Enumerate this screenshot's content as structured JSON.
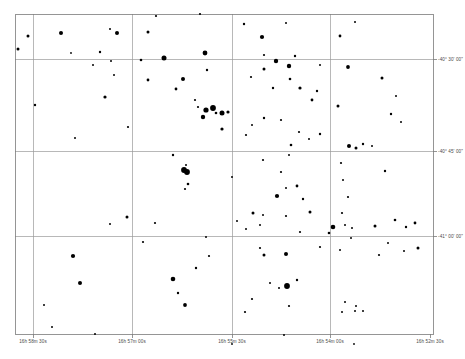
{
  "chart_data": {
    "type": "scatter",
    "title": "",
    "xlabel": "",
    "ylabel": "",
    "grid": true,
    "legend": null,
    "projection": "equatorial-finder-chart",
    "axes": {
      "x_tick_labels": [
        "16h 58m 30s",
        "16h 57m 00s",
        "16h 55m 30s",
        "16h 54m 00s",
        "16h 52m 30s"
      ],
      "x_tick_px": [
        33,
        132,
        232,
        330,
        430
      ],
      "y_tick_labels": [
        "-40° 30' 00\"",
        "-40° 45' 00\"",
        "-41° 00' 00\""
      ],
      "y_tick_px": [
        59,
        151,
        236
      ],
      "frame_px": {
        "left": 15,
        "top": 14,
        "right": 433,
        "bottom": 334
      },
      "grid_lines_x_px": [
        33,
        132,
        232,
        330
      ],
      "grid_lines_y_px": [
        59,
        151,
        236
      ]
    },
    "point_marker": "filled-circle",
    "point_color": "#000000",
    "point_size_meaning": "brighter stars drawn larger",
    "points": [
      {
        "x": 28,
        "y": 36,
        "r": 1.5
      },
      {
        "x": 18,
        "y": 49,
        "r": 1.5
      },
      {
        "x": 61,
        "y": 33,
        "r": 2.0
      },
      {
        "x": 110,
        "y": 29,
        "r": 1.0
      },
      {
        "x": 117,
        "y": 33,
        "r": 2.0
      },
      {
        "x": 71,
        "y": 53,
        "r": 0.9
      },
      {
        "x": 100,
        "y": 52,
        "r": 1.2
      },
      {
        "x": 93,
        "y": 65,
        "r": 1.0
      },
      {
        "x": 111,
        "y": 61,
        "r": 1.0
      },
      {
        "x": 114,
        "y": 75,
        "r": 1.0
      },
      {
        "x": 35,
        "y": 105,
        "r": 1.2
      },
      {
        "x": 105,
        "y": 97,
        "r": 1.6
      },
      {
        "x": 128,
        "y": 127,
        "r": 1.1
      },
      {
        "x": 75,
        "y": 138,
        "r": 1.0
      },
      {
        "x": 156,
        "y": 16,
        "r": 1.1
      },
      {
        "x": 148,
        "y": 32,
        "r": 1.5
      },
      {
        "x": 200,
        "y": 14,
        "r": 1.1
      },
      {
        "x": 141,
        "y": 60,
        "r": 1.3
      },
      {
        "x": 164,
        "y": 58,
        "r": 2.5
      },
      {
        "x": 205,
        "y": 53,
        "r": 2.4
      },
      {
        "x": 148,
        "y": 80,
        "r": 1.4
      },
      {
        "x": 183,
        "y": 79,
        "r": 2.0
      },
      {
        "x": 176,
        "y": 89,
        "r": 1.4
      },
      {
        "x": 207,
        "y": 70,
        "r": 1.2
      },
      {
        "x": 198,
        "y": 107,
        "r": 1.1
      },
      {
        "x": 206,
        "y": 110,
        "r": 2.6
      },
      {
        "x": 213,
        "y": 108,
        "r": 2.9
      },
      {
        "x": 216,
        "y": 113,
        "r": 1.3
      },
      {
        "x": 222,
        "y": 113,
        "r": 2.5
      },
      {
        "x": 228,
        "y": 112,
        "r": 1.6
      },
      {
        "x": 203,
        "y": 117,
        "r": 2.2
      },
      {
        "x": 195,
        "y": 100,
        "r": 1.1
      },
      {
        "x": 222,
        "y": 129,
        "r": 1.6
      },
      {
        "x": 173,
        "y": 155,
        "r": 1.2
      },
      {
        "x": 186,
        "y": 165,
        "r": 1.0
      },
      {
        "x": 184,
        "y": 170,
        "r": 2.9
      },
      {
        "x": 244,
        "y": 24,
        "r": 1.2
      },
      {
        "x": 286,
        "y": 23,
        "r": 1.0
      },
      {
        "x": 340,
        "y": 36,
        "r": 1.4
      },
      {
        "x": 355,
        "y": 22,
        "r": 1.0
      },
      {
        "x": 262,
        "y": 37,
        "r": 2.1
      },
      {
        "x": 264,
        "y": 55,
        "r": 1.1
      },
      {
        "x": 295,
        "y": 56,
        "r": 1.2
      },
      {
        "x": 264,
        "y": 69,
        "r": 1.5
      },
      {
        "x": 276,
        "y": 61,
        "r": 2.2
      },
      {
        "x": 289,
        "y": 66,
        "r": 2.2
      },
      {
        "x": 320,
        "y": 65,
        "r": 1.0
      },
      {
        "x": 348,
        "y": 67,
        "r": 1.9
      },
      {
        "x": 251,
        "y": 77,
        "r": 1.1
      },
      {
        "x": 290,
        "y": 79,
        "r": 1.3
      },
      {
        "x": 273,
        "y": 88,
        "r": 1.2
      },
      {
        "x": 300,
        "y": 88,
        "r": 1.6
      },
      {
        "x": 312,
        "y": 100,
        "r": 1.4
      },
      {
        "x": 317,
        "y": 91,
        "r": 1.2
      },
      {
        "x": 382,
        "y": 78,
        "r": 1.5
      },
      {
        "x": 396,
        "y": 96,
        "r": 1.0
      },
      {
        "x": 338,
        "y": 106,
        "r": 1.5
      },
      {
        "x": 252,
        "y": 125,
        "r": 1.0
      },
      {
        "x": 264,
        "y": 118,
        "r": 1.2
      },
      {
        "x": 281,
        "y": 120,
        "r": 1.1
      },
      {
        "x": 246,
        "y": 135,
        "r": 1.1
      },
      {
        "x": 291,
        "y": 145,
        "r": 1.3
      },
      {
        "x": 299,
        "y": 132,
        "r": 1.1
      },
      {
        "x": 309,
        "y": 139,
        "r": 1.0
      },
      {
        "x": 320,
        "y": 134,
        "r": 1.2
      },
      {
        "x": 349,
        "y": 146,
        "r": 2.0
      },
      {
        "x": 356,
        "y": 148,
        "r": 1.5
      },
      {
        "x": 363,
        "y": 144,
        "r": 1.2
      },
      {
        "x": 372,
        "y": 146,
        "r": 1.0
      },
      {
        "x": 391,
        "y": 114,
        "r": 1.2
      },
      {
        "x": 401,
        "y": 122,
        "r": 1.0
      },
      {
        "x": 263,
        "y": 160,
        "r": 1.1
      },
      {
        "x": 289,
        "y": 155,
        "r": 1.0
      },
      {
        "x": 188,
        "y": 184,
        "r": 1.3
      },
      {
        "x": 185,
        "y": 189,
        "r": 1.1
      },
      {
        "x": 187,
        "y": 172,
        "r": 2.9
      },
      {
        "x": 232,
        "y": 177,
        "r": 1.0
      },
      {
        "x": 281,
        "y": 172,
        "r": 1.1
      },
      {
        "x": 286,
        "y": 188,
        "r": 1.0
      },
      {
        "x": 297,
        "y": 186,
        "r": 1.4
      },
      {
        "x": 341,
        "y": 163,
        "r": 1.1
      },
      {
        "x": 343,
        "y": 180,
        "r": 1.0
      },
      {
        "x": 385,
        "y": 171,
        "r": 1.2
      },
      {
        "x": 348,
        "y": 197,
        "r": 1.1
      },
      {
        "x": 253,
        "y": 213,
        "r": 1.5
      },
      {
        "x": 155,
        "y": 223,
        "r": 1.1
      },
      {
        "x": 286,
        "y": 216,
        "r": 1.1
      },
      {
        "x": 277,
        "y": 196,
        "r": 2.1
      },
      {
        "x": 303,
        "y": 199,
        "r": 1.2
      },
      {
        "x": 310,
        "y": 212,
        "r": 1.5
      },
      {
        "x": 329,
        "y": 233,
        "r": 1.3
      },
      {
        "x": 237,
        "y": 221,
        "r": 1.0
      },
      {
        "x": 246,
        "y": 229,
        "r": 1.0
      },
      {
        "x": 260,
        "y": 225,
        "r": 1.0
      },
      {
        "x": 263,
        "y": 215,
        "r": 1.0
      },
      {
        "x": 300,
        "y": 232,
        "r": 1.1
      },
      {
        "x": 333,
        "y": 227,
        "r": 2.3
      },
      {
        "x": 345,
        "y": 225,
        "r": 1.0
      },
      {
        "x": 352,
        "y": 228,
        "r": 1.0
      },
      {
        "x": 342,
        "y": 213,
        "r": 1.1
      },
      {
        "x": 375,
        "y": 226,
        "r": 1.5
      },
      {
        "x": 395,
        "y": 220,
        "r": 1.3
      },
      {
        "x": 406,
        "y": 227,
        "r": 1.2
      },
      {
        "x": 415,
        "y": 223,
        "r": 1.4
      },
      {
        "x": 418,
        "y": 248,
        "r": 1.5
      },
      {
        "x": 73,
        "y": 256,
        "r": 2.1
      },
      {
        "x": 44,
        "y": 305,
        "r": 1.0
      },
      {
        "x": 95,
        "y": 334,
        "r": 1.0
      },
      {
        "x": 173,
        "y": 279,
        "r": 2.3
      },
      {
        "x": 178,
        "y": 293,
        "r": 1.2
      },
      {
        "x": 185,
        "y": 305,
        "r": 1.9
      },
      {
        "x": 196,
        "y": 268,
        "r": 1.2
      },
      {
        "x": 286,
        "y": 254,
        "r": 2.0
      },
      {
        "x": 287,
        "y": 286,
        "r": 2.9
      },
      {
        "x": 270,
        "y": 283,
        "r": 1.0
      },
      {
        "x": 279,
        "y": 288,
        "r": 1.0
      },
      {
        "x": 297,
        "y": 280,
        "r": 1.2
      },
      {
        "x": 264,
        "y": 255,
        "r": 1.5
      },
      {
        "x": 260,
        "y": 248,
        "r": 1.1
      },
      {
        "x": 320,
        "y": 247,
        "r": 1.1
      },
      {
        "x": 340,
        "y": 250,
        "r": 1.0
      },
      {
        "x": 351,
        "y": 238,
        "r": 1.0
      },
      {
        "x": 342,
        "y": 312,
        "r": 1.0
      },
      {
        "x": 355,
        "y": 311,
        "r": 1.0
      },
      {
        "x": 345,
        "y": 302,
        "r": 1.0
      },
      {
        "x": 356,
        "y": 306,
        "r": 1.0
      },
      {
        "x": 363,
        "y": 311,
        "r": 1.0
      },
      {
        "x": 284,
        "y": 335,
        "r": 1.0
      },
      {
        "x": 289,
        "y": 306,
        "r": 1.1
      },
      {
        "x": 232,
        "y": 344,
        "r": 0.9
      },
      {
        "x": 354,
        "y": 344,
        "r": 0.9
      },
      {
        "x": 206,
        "y": 237,
        "r": 1.0
      },
      {
        "x": 209,
        "y": 256,
        "r": 1.1
      },
      {
        "x": 127,
        "y": 217,
        "r": 1.5
      },
      {
        "x": 110,
        "y": 224,
        "r": 1.0
      },
      {
        "x": 143,
        "y": 242,
        "r": 1.1
      },
      {
        "x": 80,
        "y": 283,
        "r": 2.0
      },
      {
        "x": 252,
        "y": 299,
        "r": 1.1
      },
      {
        "x": 245,
        "y": 312,
        "r": 1.1
      },
      {
        "x": 379,
        "y": 255,
        "r": 1.1
      },
      {
        "x": 388,
        "y": 243,
        "r": 1.0
      },
      {
        "x": 404,
        "y": 251,
        "r": 1.0
      },
      {
        "x": 52,
        "y": 327,
        "r": 1.0
      }
    ]
  },
  "chart": {
    "frame_color": "#7a7a7a",
    "grid_color": "#9a9a9a",
    "background_color": "#ffffff",
    "star_color": "#000000"
  }
}
